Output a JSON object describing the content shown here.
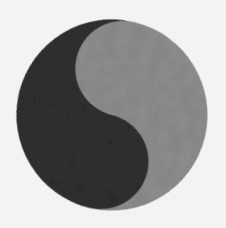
{
  "image": {
    "subject": "yin-yang symbol without dots",
    "colors": {
      "background": "#f3f3f3",
      "light_half": "#8f8f8f",
      "dark_half": "#333333"
    }
  }
}
